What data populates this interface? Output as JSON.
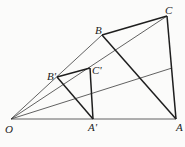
{
  "diagram": {
    "type": "geometry-homothety",
    "points": {
      "O": {
        "label": "O",
        "x": 11,
        "y": 119
      },
      "A": {
        "label": "A",
        "x": 176,
        "y": 119
      },
      "B": {
        "label": "B",
        "x": 102,
        "y": 35
      },
      "C": {
        "label": "C",
        "x": 167,
        "y": 16
      },
      "A_prime": {
        "label": "A'",
        "x": 93,
        "y": 119
      },
      "B_prime": {
        "label": "B'",
        "x": 57,
        "y": 77
      },
      "C_prime": {
        "label": "C'",
        "x": 90,
        "y": 68
      }
    },
    "segments_thick": [
      "B-C",
      "C-A",
      "B-A",
      "B'-C'",
      "C'-A'",
      "B'-A'"
    ],
    "segments_thin": [
      "O-A",
      "O-B",
      "O-C",
      "O-M"
    ],
    "extra_point_M": {
      "x": 172,
      "y": 68
    },
    "stroke_color": "#2a2a2a"
  }
}
